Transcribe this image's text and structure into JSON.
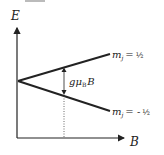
{
  "diagram": {
    "type": "zeeman-splitting",
    "axes": {
      "y_label": "E",
      "x_label": "B"
    },
    "levels": [
      {
        "label_prefix": "m",
        "label_sub": "j",
        "label_eq": "=",
        "label_value": "½",
        "direction": "up"
      },
      {
        "label_prefix": "m",
        "label_sub": "j",
        "label_eq": "= -",
        "label_value": "½",
        "direction": "down"
      }
    ],
    "splitting": {
      "g": "g",
      "mu": "μ",
      "mu_sub": "B",
      "field": "B"
    },
    "colors": {
      "line": "#222222",
      "background": "#ffffff"
    }
  }
}
